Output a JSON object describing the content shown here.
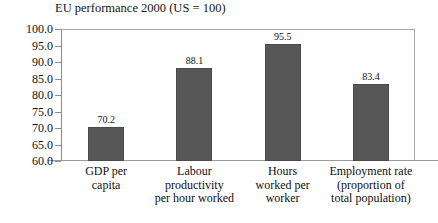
{
  "chart_data": {
    "type": "bar",
    "title": "EU performance 2000 (US = 100)",
    "xlabel": "",
    "ylabel": "",
    "ylim": [
      60.0,
      100.0
    ],
    "ytick_step": 5.0,
    "grid": false,
    "legend": "none",
    "bar_color": "#575757",
    "categories": [
      "GDP per capita",
      "Labour productivity per hour worked",
      "Hours worked per worker",
      "Employment rate (proportion of total population)"
    ],
    "category_lines": [
      [
        "GDP per",
        "capita"
      ],
      [
        "Labour",
        "productivity",
        "per hour worked"
      ],
      [
        "Hours",
        "worked per",
        "worker"
      ],
      [
        "Employment rate",
        "(proportion of",
        "total population)"
      ]
    ],
    "values": [
      70.2,
      88.1,
      95.5,
      83.4
    ],
    "value_labels": [
      "70.2",
      "88.1",
      "95.5",
      "83.4"
    ],
    "ytick_labels": [
      "100.0",
      "95.0",
      "90.0",
      "85.0",
      "80.0",
      "75.0",
      "70.0",
      "65.0",
      "60.0"
    ],
    "ytick_values": [
      100.0,
      95.0,
      90.0,
      85.0,
      80.0,
      75.0,
      70.0,
      65.0,
      60.0
    ]
  }
}
